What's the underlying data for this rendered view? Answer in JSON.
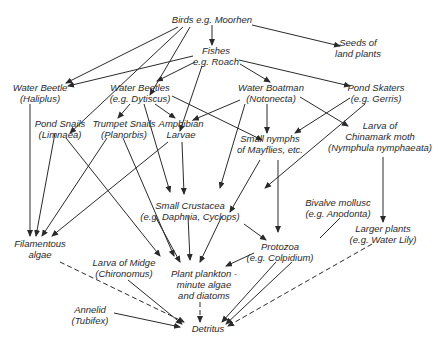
{
  "nodes": {
    "birds": {
      "l1": "Birds e.g. Moorhen"
    },
    "seeds": {
      "l1": "Seeds of",
      "l2": "land plants"
    },
    "fishes": {
      "l1": "Fishes",
      "l2": "e.g. Roach"
    },
    "water_beetle": {
      "l1": "Water Beetle",
      "l2": "(Haliplus)"
    },
    "water_beetles": {
      "l1": "Water Beetles",
      "l2": "(e.g. Dytiscus)"
    },
    "water_boatman": {
      "l1": "Water Boatman",
      "l2": "(Notonecta)"
    },
    "pond_skaters": {
      "l1": "Pond Skaters",
      "l2": "(e.g. Gerris)"
    },
    "pond_snails": {
      "l1": "Pond Snails",
      "l2": "(Limnaea)"
    },
    "trumpet_snails": {
      "l1": "Trumpet Snails",
      "l2": "(Planorbis)"
    },
    "amphibian": {
      "l1": "Amphibian",
      "l2": "Larvae"
    },
    "nymphs": {
      "l1": "Small nymphs",
      "l2": "of Mayflies, etc."
    },
    "chinamark": {
      "l1": "Larva of",
      "l2": "Chinamark moth",
      "l3": "(Nymphula nymphaeata)"
    },
    "crustacea": {
      "l1": "Small Crustacea",
      "l2": "(e.g. Daphnia, Cyclops)"
    },
    "bivalve": {
      "l1": "Bivalve mollusc",
      "l2": "(e.g. Anodonta)"
    },
    "larger_plants": {
      "l1": "Larger plants",
      "l2": "(e.g. Water Lily)"
    },
    "filamentous": {
      "l1": "Filamentous",
      "l2": "algae"
    },
    "midge": {
      "l1": "Larva of Midge",
      "l2": "(Chironomus)"
    },
    "protozoa": {
      "l1": "Protozoa",
      "l2": "(e.g. Colpidium)"
    },
    "plankton": {
      "l1": "Plant plankton -",
      "l2": "minute algae",
      "l3": "and diatoms"
    },
    "annelid": {
      "l1": "Annelid",
      "l2": "(Tubifex)"
    },
    "detritus": {
      "l1": "Detritus"
    }
  },
  "line_color": "#2a2a2a"
}
